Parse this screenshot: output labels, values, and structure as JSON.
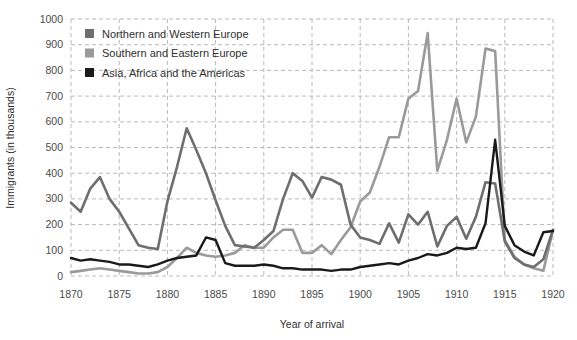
{
  "chart_data": {
    "type": "line",
    "title": "",
    "xlabel": "Year of arrival",
    "ylabel": "Immigrants (in thousands)",
    "xlim": [
      1870,
      1920
    ],
    "ylim": [
      0,
      1000
    ],
    "grid": true,
    "legend_position": "top-left",
    "x_ticks": [
      "1870",
      "1875",
      "1880",
      "1885",
      "1890",
      "1895",
      "1900",
      "1905",
      "1910",
      "1915",
      "1920"
    ],
    "y_ticks": [
      "0",
      "100",
      "200",
      "300",
      "400",
      "500",
      "600",
      "700",
      "800",
      "900",
      "1000"
    ],
    "x": [
      1870,
      1871,
      1872,
      1873,
      1874,
      1875,
      1876,
      1877,
      1878,
      1879,
      1880,
      1881,
      1882,
      1883,
      1884,
      1885,
      1886,
      1887,
      1888,
      1889,
      1890,
      1891,
      1892,
      1893,
      1894,
      1895,
      1896,
      1897,
      1898,
      1899,
      1900,
      1901,
      1902,
      1903,
      1904,
      1905,
      1906,
      1907,
      1908,
      1909,
      1910,
      1911,
      1912,
      1913,
      1914,
      1915,
      1916,
      1917,
      1918,
      1919,
      1920
    ],
    "series": [
      {
        "name": "Northern and Western Europe",
        "color": "#6e6e6e",
        "values": [
          285,
          250,
          340,
          385,
          300,
          250,
          185,
          120,
          110,
          105,
          290,
          425,
          575,
          490,
          400,
          295,
          195,
          120,
          115,
          110,
          140,
          175,
          300,
          400,
          370,
          305,
          385,
          375,
          355,
          200,
          150,
          140,
          125,
          205,
          130,
          240,
          200,
          250,
          115,
          195,
          230,
          145,
          230,
          365,
          360,
          135,
          70,
          45,
          35,
          65,
          180
        ]
      },
      {
        "name": "Southern and Eastern Europe",
        "color": "#9a9a9a",
        "values": [
          15,
          20,
          25,
          30,
          25,
          20,
          15,
          10,
          10,
          15,
          35,
          70,
          110,
          90,
          80,
          75,
          80,
          90,
          120,
          110,
          110,
          150,
          180,
          180,
          90,
          90,
          120,
          85,
          140,
          190,
          290,
          325,
          425,
          540,
          540,
          690,
          720,
          945,
          410,
          530,
          690,
          520,
          620,
          885,
          875,
          140,
          75,
          45,
          30,
          20,
          180
        ]
      },
      {
        "name": "Asia, Africa and the Americas",
        "color": "#1a1a1a",
        "values": [
          70,
          60,
          65,
          60,
          55,
          45,
          45,
          40,
          35,
          45,
          60,
          70,
          75,
          80,
          150,
          140,
          50,
          40,
          40,
          40,
          45,
          40,
          30,
          30,
          25,
          25,
          25,
          20,
          25,
          25,
          35,
          40,
          45,
          50,
          45,
          60,
          70,
          85,
          80,
          90,
          110,
          105,
          110,
          205,
          530,
          195,
          120,
          95,
          80,
          170,
          175
        ]
      }
    ]
  },
  "legend": {
    "items": [
      {
        "label": "Northern and Western Europe",
        "swatch": "#6e6e6e"
      },
      {
        "label": "Southern and Eastern Europe",
        "swatch": "#9a9a9a"
      },
      {
        "label": "Asia, Africa and the Americas",
        "swatch": "#1a1a1a"
      }
    ]
  }
}
